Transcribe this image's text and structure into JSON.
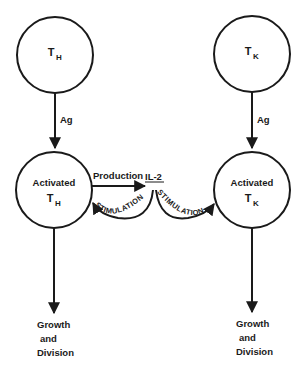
{
  "diagram": {
    "colors": {
      "stroke": "#1a1a1a",
      "background": "#ffffff"
    },
    "nodes": [
      {
        "id": "th",
        "main": "T",
        "sub": "H"
      },
      {
        "id": "tk",
        "main": "T",
        "sub": "K"
      },
      {
        "id": "act_th",
        "line1": "Activated",
        "main": "T",
        "sub": "H"
      },
      {
        "id": "act_tk",
        "line1": "Activated",
        "main": "T",
        "sub": "K"
      }
    ],
    "edges": [
      {
        "from": "th",
        "to": "act_th",
        "label": "Ag"
      },
      {
        "from": "tk",
        "to": "act_tk",
        "label": "Ag"
      },
      {
        "from": "act_th",
        "to": "il2",
        "label": "Production"
      },
      {
        "from": "il2",
        "to": "act_th",
        "label": "STIMULATION"
      },
      {
        "from": "il2",
        "to": "act_tk",
        "label": "STIMULATION"
      }
    ],
    "mediator": {
      "label": "IL-2"
    },
    "outcomes": [
      {
        "line1": "Growth",
        "line2": "and",
        "line3": "Division"
      },
      {
        "line1": "Growth",
        "line2": "and",
        "line3": "Division"
      }
    ]
  }
}
